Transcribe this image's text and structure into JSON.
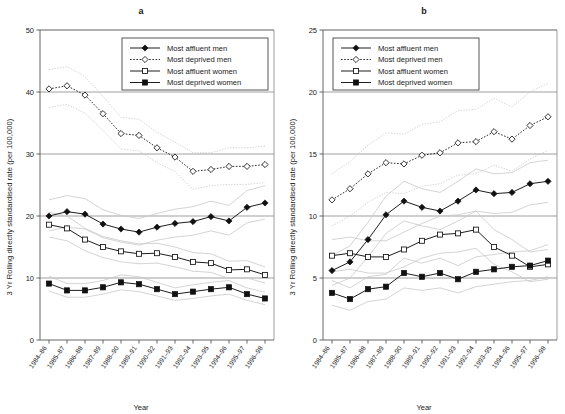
{
  "figure": {
    "ylabel": "3 Yr Rolling directly standardised rate (per 100,000)",
    "xlabel": "Year",
    "categories": [
      "1984–86",
      "1985–87",
      "1986–88",
      "1987–89",
      "1988–90",
      "1989–91",
      "1990–92",
      "1991–93",
      "1992–94",
      "1993–95",
      "1994–96",
      "1995–97",
      "1996–98"
    ],
    "legend": [
      {
        "label": "Most affluent men",
        "marker": "filled-diamond",
        "line": "solid"
      },
      {
        "label": "Most deprived men",
        "marker": "open-diamond",
        "line": "dotted"
      },
      {
        "label": "Most affluent women",
        "marker": "open-square",
        "line": "solid"
      },
      {
        "label": "Most deprived women",
        "marker": "filled-square",
        "line": "solid"
      }
    ]
  },
  "chart_data": [
    {
      "type": "line",
      "title": "a",
      "xlabel": "Year",
      "ylabel": "3 Yr Rolling directly standardised rate (per 100,000)",
      "ylim": [
        0,
        50
      ],
      "yticks": [
        0,
        10,
        20,
        30,
        40,
        50
      ],
      "grid": true,
      "legend_position": "top-right-inside",
      "categories": [
        "1984–86",
        "1985–87",
        "1986–88",
        "1987–89",
        "1988–90",
        "1989–91",
        "1990–92",
        "1991–93",
        "1992–94",
        "1993–95",
        "1994–96",
        "1995–97",
        "1996–98"
      ],
      "series": [
        {
          "name": "Most affluent men",
          "marker": "filled-diamond",
          "values": [
            20.0,
            20.7,
            20.3,
            18.7,
            17.9,
            17.4,
            18.2,
            18.8,
            19.1,
            19.9,
            19.2,
            21.4,
            22.1
          ],
          "ci_upper": [
            22.6,
            23.3,
            22.8,
            21.0,
            20.1,
            19.6,
            20.4,
            21.1,
            21.5,
            22.4,
            21.7,
            24.1,
            24.9
          ],
          "ci_lower": [
            17.6,
            18.2,
            17.9,
            16.5,
            15.8,
            15.3,
            16.1,
            16.6,
            16.9,
            17.6,
            16.9,
            18.9,
            19.5
          ]
        },
        {
          "name": "Most deprived men",
          "marker": "open-diamond",
          "values": [
            40.5,
            41.0,
            39.5,
            36.5,
            33.3,
            33.0,
            31.0,
            29.5,
            27.2,
            27.5,
            28.0,
            28.0,
            28.3
          ],
          "ci_upper": [
            43.6,
            44.1,
            42.5,
            39.3,
            35.9,
            35.6,
            33.5,
            31.9,
            30.2,
            30.2,
            31.0,
            31.0,
            31.3
          ],
          "ci_lower": [
            37.5,
            38.0,
            36.6,
            33.8,
            30.8,
            30.5,
            28.6,
            27.2,
            24.3,
            24.9,
            25.1,
            25.1,
            25.4
          ]
        },
        {
          "name": "Most affluent women",
          "marker": "open-square",
          "values": [
            18.6,
            18.0,
            16.2,
            15.0,
            14.3,
            13.9,
            14.0,
            13.4,
            12.6,
            12.4,
            11.3,
            11.4,
            10.5,
            10.1
          ],
          "ci_upper": [
            20.6,
            20.0,
            18.0,
            16.7,
            16.0,
            15.5,
            15.6,
            15.0,
            14.1,
            13.9,
            12.7,
            12.8,
            11.8
          ],
          "ci_lower": [
            16.6,
            16.0,
            14.4,
            13.3,
            12.6,
            12.3,
            12.4,
            11.8,
            11.1,
            10.9,
            9.9,
            10.0,
            9.2
          ]
        },
        {
          "name": "Most deprived women",
          "marker": "filled-square",
          "values": [
            9.1,
            8.0,
            8.0,
            8.5,
            9.3,
            9.0,
            8.2,
            7.4,
            7.8,
            8.2,
            8.5,
            7.4,
            6.7
          ],
          "ci_upper": [
            10.3,
            9.1,
            9.1,
            9.6,
            10.5,
            10.2,
            9.3,
            8.4,
            8.9,
            9.3,
            9.6,
            8.4,
            7.7
          ],
          "ci_lower": [
            7.9,
            6.9,
            6.9,
            7.4,
            8.1,
            7.8,
            7.1,
            6.4,
            6.7,
            7.1,
            7.4,
            6.4,
            5.7
          ]
        }
      ]
    },
    {
      "type": "line",
      "title": "b",
      "xlabel": "Year",
      "ylabel": "3 Yr Rolling directly standardised rate (per 100,000)",
      "ylim": [
        0,
        25
      ],
      "yticks": [
        0,
        5,
        10,
        15,
        20,
        25
      ],
      "grid": true,
      "legend_position": "top-left-inside",
      "categories": [
        "1984–86",
        "1985–87",
        "1986–88",
        "1987–89",
        "1988–90",
        "1989–91",
        "1990–92",
        "1991–93",
        "1992–94",
        "1993–95",
        "1994–96",
        "1995–97",
        "1996–98"
      ],
      "series": [
        {
          "name": "Most affluent men",
          "marker": "filled-diamond",
          "values": [
            5.6,
            6.3,
            8.1,
            10.1,
            11.2,
            10.7,
            10.4,
            11.2,
            12.1,
            11.8,
            11.9,
            12.6,
            12.8
          ],
          "ci_upper": [
            6.8,
            7.6,
            9.5,
            11.6,
            12.8,
            12.2,
            11.9,
            12.8,
            13.8,
            13.4,
            13.5,
            14.3,
            14.5
          ],
          "ci_lower": [
            4.4,
            5.0,
            6.7,
            8.6,
            9.6,
            9.2,
            8.9,
            9.6,
            10.4,
            10.2,
            10.3,
            10.9,
            11.1
          ]
        },
        {
          "name": "Most deprived men",
          "marker": "open-diamond",
          "values": [
            11.3,
            12.2,
            13.4,
            14.3,
            14.2,
            14.9,
            15.1,
            15.9,
            16.0,
            16.8,
            16.2,
            17.3,
            18.0
          ],
          "ci_upper": [
            13.4,
            14.4,
            15.7,
            16.7,
            16.6,
            17.4,
            17.6,
            18.5,
            18.6,
            19.5,
            18.8,
            20.0,
            20.7
          ],
          "ci_lower": [
            9.2,
            10.0,
            11.1,
            11.9,
            11.8,
            12.4,
            12.6,
            13.3,
            13.4,
            14.1,
            13.6,
            14.6,
            15.3
          ]
        },
        {
          "name": "Most affluent women",
          "marker": "open-square",
          "values": [
            6.8,
            7.0,
            6.7,
            6.7,
            7.3,
            8.0,
            8.5,
            8.6,
            8.9,
            7.5,
            6.8,
            5.9,
            6.1
          ],
          "ci_upper": [
            8.1,
            8.3,
            8.0,
            8.0,
            8.7,
            9.4,
            10.0,
            10.1,
            10.4,
            8.9,
            8.1,
            7.1,
            7.3
          ],
          "ci_lower": [
            5.5,
            5.7,
            5.4,
            5.4,
            5.9,
            6.6,
            7.0,
            7.1,
            7.4,
            6.1,
            5.5,
            4.7,
            4.9
          ]
        },
        {
          "name": "Most deprived women",
          "marker": "filled-square",
          "values": [
            3.8,
            3.3,
            4.1,
            4.3,
            5.4,
            5.1,
            5.4,
            4.9,
            5.5,
            5.7,
            5.9,
            6.0,
            6.4
          ],
          "ci_upper": [
            4.8,
            4.2,
            5.1,
            5.3,
            6.6,
            6.2,
            6.6,
            6.0,
            6.7,
            6.9,
            7.1,
            7.2,
            7.7
          ],
          "ci_lower": [
            2.8,
            2.4,
            3.1,
            3.3,
            4.2,
            4.0,
            4.2,
            3.8,
            4.3,
            4.5,
            4.7,
            4.8,
            5.1
          ]
        }
      ]
    }
  ]
}
